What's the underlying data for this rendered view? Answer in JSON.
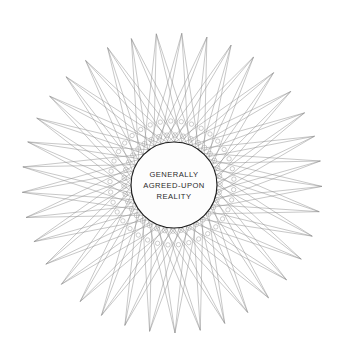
{
  "canvas": {
    "width": 347,
    "height": 362,
    "background": "#ffffff"
  },
  "figure": {
    "type": "star-polygon-diagram"
  },
  "star": {
    "center_x": 172,
    "center_y": 183,
    "radius": 150,
    "points": 37,
    "step": 16,
    "start_angle_deg": -96,
    "line_color": "#8e8e8e",
    "line_width": 0.55
  },
  "vertex_dots": {
    "show": true,
    "inner_radius": 44,
    "dot_radius": 2.6,
    "color": "#9a9a9a",
    "rings": [
      {
        "radius": 48,
        "count": 37,
        "dot_radius": 2.4
      },
      {
        "radius": 62,
        "count": 37,
        "dot_radius": 2.2
      }
    ]
  },
  "hub": {
    "center_x": 174,
    "center_y": 185,
    "radius": 43,
    "fill": "#fdfdfd",
    "stroke": "#1d1d1d",
    "stroke_width": 1.15,
    "label_lines": [
      "GENERALLY",
      "AGREED-UPON",
      "REALITY"
    ],
    "text_color": "#2a2a2a"
  }
}
